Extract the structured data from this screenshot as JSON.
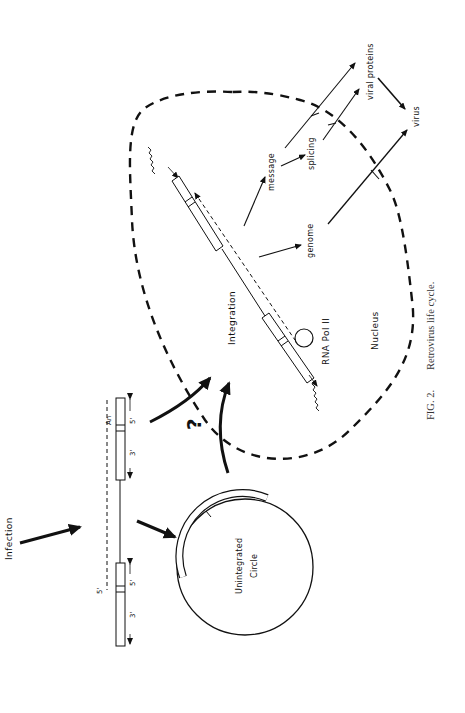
{
  "figure": {
    "caption_label": "FIG. 2.",
    "caption_text": "Retrovirus life cycle.",
    "orientation": "rotated 90° counter-clockwise"
  },
  "labels": {
    "infection": "Infection",
    "unintegrated_circle_line1": "Unintegrated",
    "unintegrated_circle_line2": "Circle",
    "question": "?",
    "integration": "Integration",
    "rna_pol": "RNA Pol II",
    "nucleus": "Nucleus",
    "genome": "genome",
    "message": "message",
    "splicing": "splicing",
    "viral_proteins": "viral proteins",
    "virus": "virus"
  },
  "dna_ends": {
    "five_prime": "5'",
    "three_prime": "3'",
    "poly_a": "An"
  }
}
